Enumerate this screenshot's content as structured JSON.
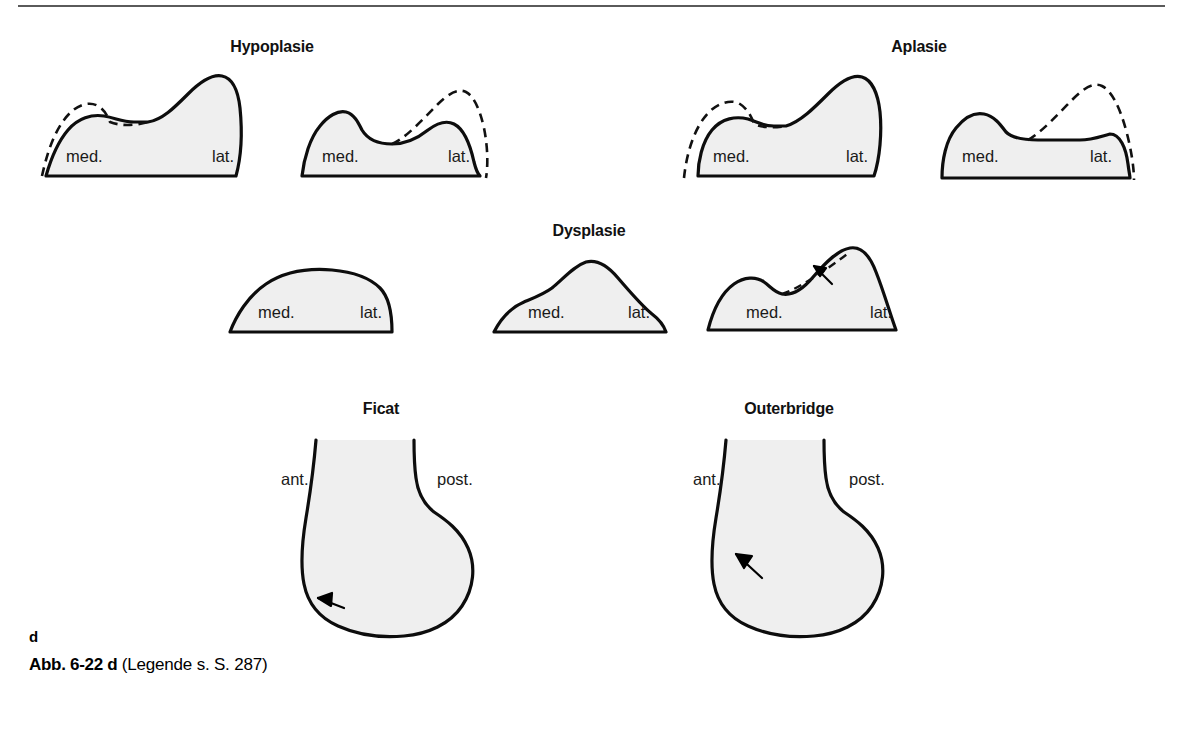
{
  "figure": {
    "panel_letter": "d",
    "caption_ref": "Abb. 6-22 d",
    "caption_note": "(Legende s. S. 287)",
    "ink_color": "#0d0d0d",
    "fill_color": "#efefef",
    "rule_color": "#5a5a5a"
  },
  "groups": {
    "hypoplasie": "Hypoplasie",
    "aplasie": "Aplasie",
    "dysplasie": "Dysplasie",
    "ficat": "Ficat",
    "outerbridge": "Outerbridge"
  },
  "labels": {
    "med": "med.",
    "lat": "lat.",
    "ant": "ant.",
    "post": "post."
  },
  "patella_row_top": [
    {
      "id": "hypoplasie-left",
      "group": "Hypoplasie",
      "medial_label": "med.",
      "lateral_label": "lat.",
      "has_ghost_outline": true,
      "ghost_side": "medial"
    },
    {
      "id": "hypoplasie-right",
      "group": "Hypoplasie",
      "medial_label": "med.",
      "lateral_label": "lat.",
      "has_ghost_outline": true,
      "ghost_side": "lateral"
    },
    {
      "id": "aplasie-left",
      "group": "Aplasie",
      "medial_label": "med.",
      "lateral_label": "lat.",
      "has_ghost_outline": true,
      "ghost_side": "medial"
    },
    {
      "id": "aplasie-right",
      "group": "Aplasie",
      "medial_label": "med.",
      "lateral_label": "lat.",
      "has_ghost_outline": true,
      "ghost_side": "lateral"
    }
  ],
  "patella_row_middle": [
    {
      "id": "dysplasie-1",
      "group": "Dysplasie",
      "medial_label": "med.",
      "lateral_label": "lat.",
      "has_ghost_outline": false,
      "has_arrow": false
    },
    {
      "id": "dysplasie-2",
      "group": "Dysplasie",
      "medial_label": "med.",
      "lateral_label": "lat.",
      "has_ghost_outline": false,
      "has_arrow": false
    },
    {
      "id": "dysplasie-3",
      "group": "Dysplasie",
      "medial_label": "med.",
      "lateral_label": "lat.",
      "has_ghost_outline": true,
      "has_arrow": true
    }
  ],
  "condyle_row": [
    {
      "id": "ficat",
      "title": "Ficat",
      "anterior_label": "ant.",
      "posterior_label": "post.",
      "has_arrow": true,
      "arrow_direction": "down-left"
    },
    {
      "id": "outerbridge",
      "title": "Outerbridge",
      "anterior_label": "ant.",
      "posterior_label": "post.",
      "has_arrow": true,
      "arrow_direction": "up-left"
    }
  ]
}
